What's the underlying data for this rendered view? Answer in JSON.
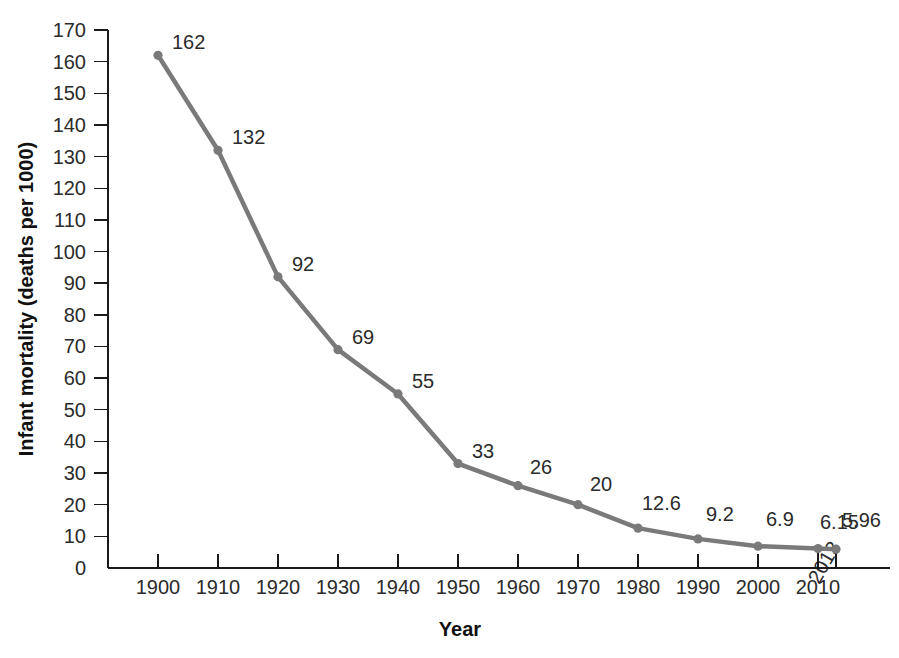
{
  "chart_data": {
    "type": "line",
    "title": "",
    "xlabel": "Year",
    "ylabel": "Infant mortality (deaths per 1000)",
    "x": [
      1900,
      1910,
      1920,
      1930,
      1940,
      1950,
      1960,
      1970,
      1980,
      1990,
      2000,
      2010,
      2013
    ],
    "values": [
      162,
      132,
      92,
      69,
      55,
      33,
      26,
      20,
      12.6,
      9.2,
      6.9,
      6.15,
      5.96
    ],
    "point_labels": [
      "162",
      "132",
      "92",
      "69",
      "55",
      "33",
      "26",
      "20",
      "12.6",
      "9.2",
      "6.9",
      "6.15",
      "5.96"
    ],
    "x_tick_labels": [
      "1900",
      "1910",
      "1920",
      "1930",
      "1940",
      "1950",
      "1960",
      "1970",
      "1980",
      "1990",
      "2000",
      "2010",
      "2013"
    ],
    "y_tick_labels": [
      "0",
      "10",
      "20",
      "30",
      "40",
      "50",
      "60",
      "70",
      "80",
      "90",
      "100",
      "110",
      "120",
      "130",
      "140",
      "150",
      "160",
      "170"
    ],
    "y_ticks": [
      0,
      10,
      20,
      30,
      40,
      50,
      60,
      70,
      80,
      90,
      100,
      110,
      120,
      130,
      140,
      150,
      160,
      170
    ],
    "ylim": [
      0,
      170
    ],
    "xlim": [
      1900,
      2013
    ],
    "grid": false,
    "legend": "none",
    "series_color": "#7a7a7a",
    "axis_color": "#1a1a1a",
    "text_color": "#2b2b2b",
    "background_color": "#ffffff",
    "last_tick_rotated": true,
    "drop_lines_at": [
      2010,
      2013
    ]
  }
}
